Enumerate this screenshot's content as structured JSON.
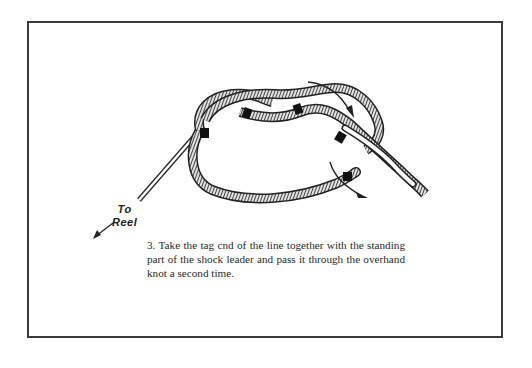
{
  "figure": {
    "step_number": "3.",
    "caption": "3. Take the tag cnd of the line together with the standing part of the shock leader and pass it through the overhand knot a second time.",
    "labels": {
      "to": "To",
      "reel": "Reel"
    },
    "elements": [
      "rope-loop-icon",
      "overhand-knot-icon",
      "direction-arrow-top-icon",
      "direction-arrow-bottom-icon",
      "to-reel-arrow-icon"
    ],
    "colors": {
      "ink": "#222222",
      "frame": "#3a3a3a",
      "background": "#ffffff"
    }
  }
}
